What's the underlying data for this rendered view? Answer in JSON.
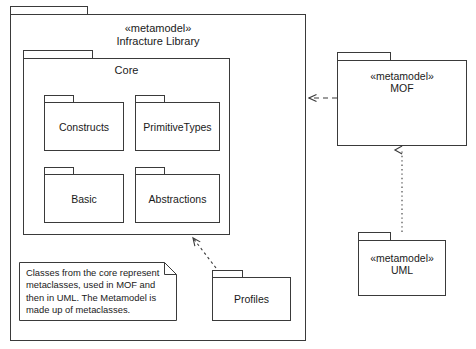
{
  "diagram": {
    "stroke_color": "#3a3a3a",
    "text_color": "#1a1a1a",
    "background": "#ffffff"
  },
  "packages": {
    "infrastructure": {
      "stereotype": "«metamodel»",
      "name": "Infracture Library",
      "label": "«metamodel»\nInfracture Library"
    },
    "core": {
      "name": "Core",
      "label": "Core"
    },
    "constructs": {
      "name": "Constructs",
      "label": "Constructs"
    },
    "primitive_types": {
      "name": "PrimitiveTypes",
      "label": "PrimitiveTypes"
    },
    "basic": {
      "name": "Basic",
      "label": "Basic"
    },
    "abstractions": {
      "name": "Abstractions",
      "label": "Abstractions"
    },
    "profiles": {
      "name": "Profiles",
      "label": "Profiles"
    },
    "mof": {
      "stereotype": "«metamodel»",
      "name": "MOF",
      "label": "«metamodel»\nMOF"
    },
    "uml": {
      "stereotype": "«metamodel»",
      "name": "UML",
      "label": "«metamodel»\nUML"
    }
  },
  "note": {
    "text": "Classes from the core represent metaclasses, used in MOF and then in UML. The Metamodel is made up of metaclasses.",
    "lines": [
      "Classes from the core represent",
      "metaclasses, used in MOF and",
      "then in UML. The Metamodel",
      "is made up of metaclasses."
    ]
  },
  "connectors": [
    {
      "id": "mof-to-infrastructure",
      "from": "mof",
      "to": "infrastructure",
      "style": "dashed",
      "arrow": "open",
      "label": ""
    },
    {
      "id": "uml-to-mof",
      "from": "uml",
      "to": "mof",
      "style": "dotted",
      "arrow": "open",
      "label": ""
    },
    {
      "id": "profiles-to-core",
      "from": "profiles",
      "to": "core",
      "style": "dashed",
      "arrow": "open",
      "label": ""
    }
  ]
}
